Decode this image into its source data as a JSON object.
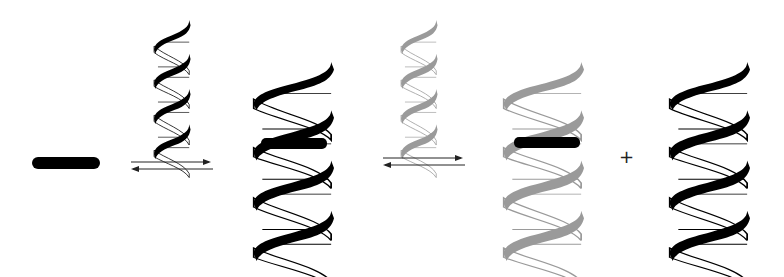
{
  "diagram": {
    "colors": {
      "strand_dark": "#000000",
      "strand_gray": "#9a9a9a",
      "ligand": "#000000",
      "background": "#ffffff"
    },
    "elements": [
      {
        "id": "ligand-free",
        "kind": "ligand-bar"
      },
      {
        "id": "helix-small-black",
        "kind": "dna-helix",
        "color": "black"
      },
      {
        "id": "equilibrium-arrows-1",
        "kind": "equilibrium-arrows"
      },
      {
        "id": "helix-black-with-ligand",
        "kind": "dna-helix-with-ligand",
        "color": "black"
      },
      {
        "id": "helix-small-gray",
        "kind": "dna-helix",
        "color": "gray"
      },
      {
        "id": "equilibrium-arrows-2",
        "kind": "equilibrium-arrows"
      },
      {
        "id": "helix-gray-with-ligand",
        "kind": "dna-helix-with-ligand",
        "color": "gray"
      },
      {
        "id": "plus-sign",
        "kind": "operator"
      },
      {
        "id": "helix-black-product",
        "kind": "dna-helix",
        "color": "black"
      }
    ],
    "plus_label": "+"
  }
}
